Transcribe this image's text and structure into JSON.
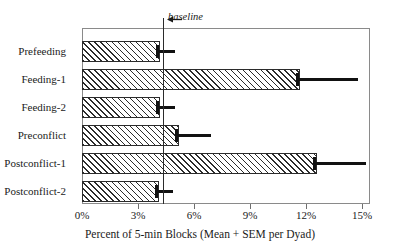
{
  "chart_data": {
    "type": "bar",
    "orientation": "horizontal",
    "title": "",
    "xlabel": "Percent of 5-min Blocks (Mean + SEM per Dyad)",
    "ylabel": "",
    "categories": [
      "Prefeeding",
      "Feeding-1",
      "Feeding-2",
      "Preconflict",
      "Postconflict-1",
      "Postconflict-2"
    ],
    "values": [
      4.2,
      11.7,
      4.2,
      5.2,
      12.6,
      4.1
    ],
    "errors_upper": [
      5.0,
      14.8,
      5.0,
      6.9,
      15.2,
      4.9
    ],
    "xlim": [
      0,
      15.4
    ],
    "xticks": [
      0,
      3,
      6,
      9,
      12,
      15
    ],
    "xticklabels": [
      "0%",
      "3%",
      "6%",
      "9%",
      "12%",
      "15%"
    ],
    "grid": false,
    "legend": "none",
    "annotations": [
      {
        "text": "baseline",
        "value": 4.34,
        "type": "vertical-reference-line"
      }
    ]
  },
  "chart": {
    "baseline_label": "baseline",
    "axis_title": "Percent of 5-min Blocks (Mean + SEM per Dyad)",
    "colors": {
      "bar_edge": "#2b2b2b",
      "bar_fill": "#ffffff",
      "hatch": "#2b2b2b",
      "error_bar": "#111111",
      "frame": "#8a8a8a",
      "baseline": "#2b2b2b",
      "text": "#1a1a1a"
    }
  }
}
